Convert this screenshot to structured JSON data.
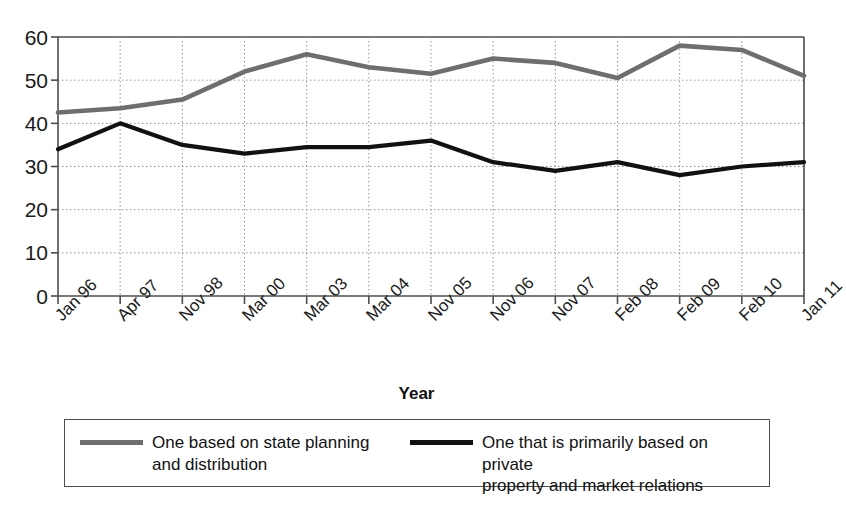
{
  "chart_data": {
    "type": "line",
    "title": "",
    "xlabel": "Year",
    "ylabel": "",
    "ylim": [
      0,
      60
    ],
    "yticks": [
      0,
      10,
      20,
      30,
      40,
      50,
      60
    ],
    "grid": true,
    "legend_position": "bottom",
    "categories": [
      "Jan 96",
      "Apr 97",
      "Nov 98",
      "Mar 00",
      "Mar 03",
      "Mar 04",
      "Nov 05",
      "Nov 06",
      "Nov 07",
      "Feb 08",
      "Feb 09",
      "Feb 10",
      "Jan 11"
    ],
    "series": [
      {
        "name": "One based on state planning and distribution",
        "color": "#6e6e6e",
        "values": [
          42.5,
          43.5,
          45.5,
          52,
          56,
          53,
          51.5,
          55,
          54,
          50.5,
          58,
          57,
          51
        ]
      },
      {
        "name": "One that is primarily based on private property and market relations",
        "color": "#111111",
        "values": [
          34,
          40,
          35,
          33,
          34.5,
          34.5,
          36,
          31,
          29,
          31,
          28,
          30,
          31
        ]
      }
    ]
  },
  "axis": {
    "x_title": "Year",
    "y_tick_labels": [
      "60",
      "50",
      "40",
      "30",
      "20",
      "10",
      "0"
    ],
    "x_tick_labels": [
      "Jan 96",
      "Apr 97",
      "Nov 98",
      "Mar 00",
      "Mar 03",
      "Mar 04",
      "Nov 05",
      "Nov 06",
      "Nov 07",
      "Feb 08",
      "Feb 09",
      "Feb 10",
      "Jan 11"
    ]
  },
  "legend": {
    "entries": [
      {
        "label_line1": "One based on state planning",
        "label_line2": "and distribution",
        "color": "#6e6e6e"
      },
      {
        "label_line1": "One that is primarily based on private",
        "label_line2": "property and market relations",
        "color": "#111111"
      }
    ]
  },
  "footer": {
    "cropped_caption": ""
  },
  "colors": {
    "series_gray": "#6e6e6e",
    "series_black": "#111111",
    "axis": "#4d4d4d",
    "grid": "#8a8a8a"
  }
}
